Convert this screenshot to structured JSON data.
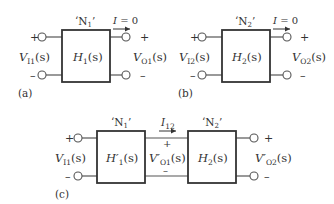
{
  "panels": {
    "a": {
      "tag": "(a)",
      "network_label": "‘N1’",
      "network_label_main": "‘N",
      "network_label_sub": "1",
      "network_label_close": "’",
      "block_main": "H",
      "block_sub": "1",
      "block_arg": "(s)",
      "input_main": "V",
      "input_sub": "I1",
      "input_arg": "(s)",
      "output_main": "V",
      "output_sub": "O1",
      "output_arg": "(s)",
      "current_label": "I = 0",
      "current_main": "I",
      "current_rest": " = 0",
      "plus": "+",
      "minus": "–"
    },
    "b": {
      "tag": "(b)",
      "network_label_main": "‘N",
      "network_label_sub": "2",
      "network_label_close": "’",
      "block_main": "H",
      "block_sub": "2",
      "block_arg": "(s)",
      "input_main": "V",
      "input_sub": "I2",
      "input_arg": "(s)",
      "output_main": "V",
      "output_sub": "O2",
      "output_arg": "(s)",
      "current_main": "I",
      "current_rest": " = 0",
      "plus": "+",
      "minus": "–"
    },
    "c": {
      "tag": "(c)",
      "net1_main": "‘N",
      "net1_sub": "1",
      "net1_close": "’",
      "net2_main": "‘N",
      "net2_sub": "2",
      "net2_close": "’",
      "block1_main": "H′",
      "block1_sub": "1",
      "block1_arg": "(s)",
      "block2_main": "H",
      "block2_sub": "2",
      "block2_arg": "(s)",
      "input_main": "V",
      "input_sub": "I1",
      "input_arg": "(s)",
      "mid_main": "V′",
      "mid_sub": "O1",
      "mid_arg": "(s)",
      "output_main": "V′",
      "output_sub": "O2",
      "output_arg": "(s)",
      "current_main": "I",
      "current_sub": "12",
      "plus": "+",
      "minus": "–"
    }
  }
}
